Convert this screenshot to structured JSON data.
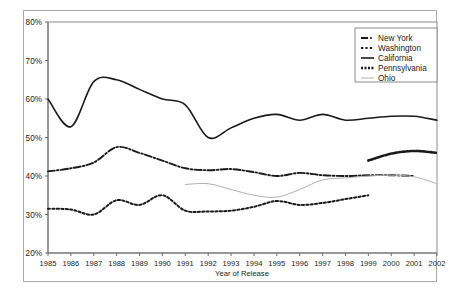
{
  "chart_data": {
    "type": "line",
    "title": "",
    "xlabel": "Year of Release",
    "ylabel": "",
    "x": [
      1985,
      1986,
      1987,
      1988,
      1989,
      1990,
      1991,
      1992,
      1993,
      1994,
      1995,
      1996,
      1997,
      1998,
      1999,
      2000,
      2001,
      2002
    ],
    "xlim": [
      1985,
      2002
    ],
    "ylim": [
      20,
      80
    ],
    "ytick_values": [
      20,
      30,
      40,
      50,
      60,
      70,
      80
    ],
    "ytick_labels": [
      "20%",
      "30%",
      "40%",
      "50%",
      "60%",
      "70%",
      "80%"
    ],
    "xtick_labels": [
      "1985",
      "1986",
      "1987",
      "1988",
      "1989",
      "1990",
      "1991",
      "1992",
      "1993",
      "1994",
      "1995",
      "1996",
      "1997",
      "1998",
      "1999",
      "2000",
      "2001",
      "2002"
    ],
    "grid": false,
    "legend_position": "top-right",
    "series": [
      {
        "name": "New York",
        "style": "dash-dot",
        "color": "#1a1a1a",
        "x": [
          1985,
          1986,
          1987,
          1988,
          1989,
          1990,
          1991,
          1992,
          1993,
          1994,
          1995,
          1996,
          1997,
          1998,
          1999,
          2000,
          2001
        ],
        "values": [
          41.2,
          42.0,
          43.5,
          47.5,
          46.0,
          44.0,
          42.0,
          41.5,
          41.8,
          41.0,
          40.0,
          40.8,
          40.2,
          40.0,
          40.2,
          40.2,
          40.0
        ]
      },
      {
        "name": "Washington",
        "style": "dotted",
        "color": "#1a1a1a",
        "x": [
          1985,
          1986,
          1987,
          1988,
          1989,
          1990,
          1991,
          1992,
          1993,
          1994,
          1995,
          1996,
          1997,
          1998,
          1999
        ],
        "values": [
          31.5,
          31.3,
          30.0,
          33.7,
          32.5,
          35.0,
          31.0,
          30.8,
          31.0,
          32.0,
          33.5,
          32.5,
          33.0,
          34.0,
          35.0
        ]
      },
      {
        "name": "California",
        "style": "solid",
        "color": "#1a1a1a",
        "x": [
          1985,
          1986,
          1987,
          1988,
          1989,
          1990,
          1991,
          1992,
          1993,
          1994,
          1995,
          1996,
          1997,
          1998,
          1999,
          2000,
          2001,
          2002
        ],
        "values": [
          60.0,
          52.8,
          64.5,
          65.0,
          62.5,
          60.0,
          58.5,
          50.0,
          52.5,
          55.0,
          56.0,
          54.5,
          56.0,
          54.5,
          55.0,
          55.5,
          55.5,
          54.5
        ]
      },
      {
        "name": "Pennsylvania",
        "style": "thick-dotted",
        "color": "#1a1a1a",
        "x": [
          1999,
          2000,
          2001,
          2002
        ],
        "values": [
          44.0,
          45.8,
          46.5,
          46.0
        ]
      },
      {
        "name": "Ohio",
        "style": "thin-light",
        "color": "#b0b0b0",
        "x": [
          1991,
          1992,
          1993,
          1994,
          1995,
          1996,
          1997,
          1998,
          1999,
          2000,
          2001,
          2002
        ],
        "values": [
          37.8,
          38.0,
          36.5,
          35.0,
          34.5,
          36.5,
          39.0,
          39.5,
          40.0,
          40.2,
          39.8,
          38.0
        ]
      }
    ]
  },
  "axes": {
    "x_title": "Year of Release"
  },
  "legend": {
    "items": [
      {
        "label": "New York"
      },
      {
        "label": "Washington"
      },
      {
        "label": "California"
      },
      {
        "label": "Pennsylvania"
      },
      {
        "label": "Ohio"
      }
    ]
  }
}
